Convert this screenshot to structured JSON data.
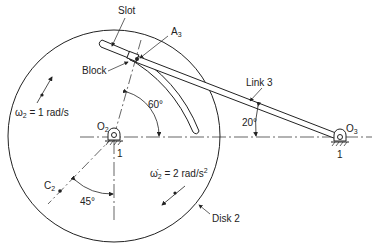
{
  "diagram": {
    "labels": {
      "slot": "Slot",
      "a3": "A",
      "a3_sub": "3",
      "block": "Block",
      "link3": "Link 3",
      "angle60": "60°",
      "angle20": "20°",
      "angle45": "45°",
      "omega_sym": "ω",
      "omega_sub": "2",
      "omega_val": " = 1 rad/s",
      "alpha_sym": "ω̇",
      "alpha_sub": "2",
      "alpha_val": " = 2 rad/s",
      "alpha_sup": "2",
      "o2": "O",
      "o2_sub": "2",
      "o3": "O",
      "o3_sub": "3",
      "ground1_a": "1",
      "ground1_b": "1",
      "c2": "C",
      "c2_sub": "2",
      "disk2": "Disk 2"
    },
    "colors": {
      "line": "#222222",
      "background": "#ffffff"
    }
  }
}
